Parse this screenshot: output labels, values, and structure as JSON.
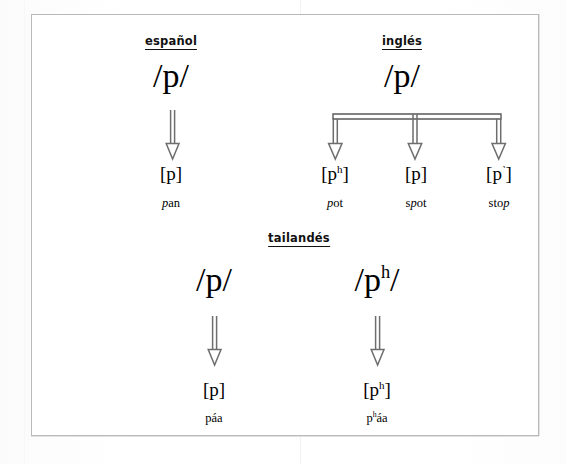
{
  "figure": {
    "type": "linguistic-diagram",
    "frame_color": "#b9b9b9",
    "arrow_color": "#6e6e6e",
    "text_color": "#000000",
    "background_color": "#ffffff"
  },
  "languages": [
    {
      "id": "spanish",
      "heading": "español",
      "phoneme": {
        "open": "/",
        "symbol": "p",
        "superscript": "",
        "close": "/"
      },
      "branches": [
        {
          "allophone_open": "[",
          "allophone_symbol": "p",
          "allophone_superscript": "",
          "allophone_close": "]",
          "example_pre": "",
          "example_italic": "p",
          "example_post": "an",
          "example_full": "pan"
        }
      ]
    },
    {
      "id": "english",
      "heading": "inglés",
      "phoneme": {
        "open": "/",
        "symbol": "p",
        "superscript": "",
        "close": "/"
      },
      "branches": [
        {
          "allophone_open": "[",
          "allophone_symbol": "p",
          "allophone_superscript": "h",
          "allophone_close": "]",
          "example_pre": "",
          "example_italic": "p",
          "example_post": "ot",
          "example_full": "pot"
        },
        {
          "allophone_open": "[",
          "allophone_symbol": "p",
          "allophone_superscript": "",
          "allophone_close": "]",
          "example_pre": "s",
          "example_italic": "p",
          "example_post": "ot",
          "example_full": "spot"
        },
        {
          "allophone_open": "[",
          "allophone_symbol": "p",
          "allophone_superscript": "˺",
          "allophone_close": "]",
          "example_pre": "sto",
          "example_italic": "p",
          "example_post": "",
          "example_full": "stop"
        }
      ]
    },
    {
      "id": "thai",
      "heading": "tailandés",
      "phonemes": [
        {
          "open": "/",
          "symbol": "p",
          "superscript": "",
          "close": "/",
          "allophone_open": "[",
          "allophone_symbol": "p",
          "allophone_superscript": "",
          "allophone_close": "]",
          "example_pre": "páa",
          "example_superscript": "",
          "example_post": "",
          "example_full": "páa"
        },
        {
          "open": "/",
          "symbol": "p",
          "superscript": "h",
          "close": "/",
          "allophone_open": "[",
          "allophone_symbol": "p",
          "allophone_superscript": "h",
          "allophone_close": "]",
          "example_pre": "p",
          "example_superscript": "h",
          "example_post": "áa",
          "example_full": "pʰáa"
        }
      ]
    }
  ]
}
